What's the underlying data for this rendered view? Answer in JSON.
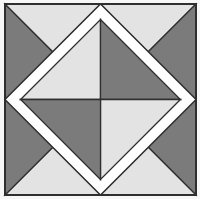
{
  "figure": {
    "colors": {
      "dark": "#7b7b7b",
      "light": "#e3e3e3",
      "band": "#ffffff",
      "line": "#2e2e2e",
      "background": "#f2f2f2"
    },
    "regions": {
      "corner_top_left": {
        "edge_triangle": "dark",
        "top_triangle": "light"
      },
      "corner_top_right": {
        "top_triangle": "light",
        "edge_triangle": "dark"
      },
      "corner_bottom_right": {
        "edge_triangle": "dark",
        "bottom_triangle": "light"
      },
      "corner_bottom_left": {
        "edge_triangle": "dark",
        "bottom_triangle": "light"
      },
      "center_diamond": {
        "top_left": "light",
        "top_right": "dark",
        "bottom_left": "dark",
        "bottom_right": "light"
      }
    }
  }
}
